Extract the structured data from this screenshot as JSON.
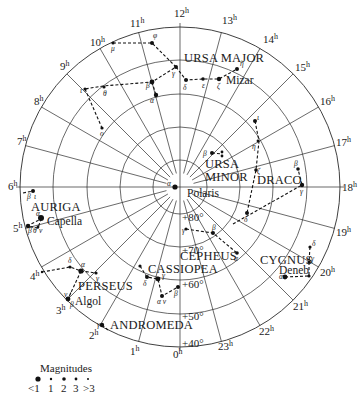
{
  "chart": {
    "center": {
      "x": 180,
      "y": 187
    },
    "outer_radius": 160,
    "colors": {
      "ink": "#1a1a1a",
      "background": "#ffffff"
    }
  },
  "ra_labels": [
    {
      "text": "12h",
      "hour": 12,
      "x": 174,
      "y": 17
    },
    {
      "text": "13h",
      "hour": 13,
      "x": 222,
      "y": 24
    },
    {
      "text": "14h",
      "hour": 14,
      "x": 263,
      "y": 43
    },
    {
      "text": "15h",
      "hour": 15,
      "x": 295,
      "y": 71
    },
    {
      "text": "16h",
      "hour": 16,
      "x": 320,
      "y": 105
    },
    {
      "text": "17h",
      "hour": 17,
      "x": 336,
      "y": 146
    },
    {
      "text": "18h",
      "hour": 18,
      "x": 342,
      "y": 191
    },
    {
      "text": "19h",
      "hour": 19,
      "x": 336,
      "y": 236
    },
    {
      "text": "20h",
      "hour": 20,
      "x": 320,
      "y": 276
    },
    {
      "text": "21h",
      "hour": 21,
      "x": 293,
      "y": 310
    },
    {
      "text": "22h",
      "hour": 22,
      "x": 259,
      "y": 335
    },
    {
      "text": "23h",
      "hour": 23,
      "x": 218,
      "y": 350
    },
    {
      "text": "0h",
      "hour": 0,
      "x": 173,
      "y": 358
    },
    {
      "text": "1h",
      "hour": 1,
      "x": 130,
      "y": 355
    },
    {
      "text": "2h",
      "hour": 2,
      "x": 89,
      "y": 339
    },
    {
      "text": "3h",
      "hour": 3,
      "x": 56,
      "y": 314
    },
    {
      "text": "4h",
      "hour": 4,
      "x": 30,
      "y": 280
    },
    {
      "text": "5h",
      "hour": 5,
      "x": 13,
      "y": 232
    },
    {
      "text": "6h",
      "hour": 6,
      "x": 8,
      "y": 190
    },
    {
      "text": "7h",
      "hour": 7,
      "x": 17,
      "y": 145
    },
    {
      "text": "8h",
      "hour": 8,
      "x": 34,
      "y": 105
    },
    {
      "text": "9h",
      "hour": 9,
      "x": 60,
      "y": 70
    },
    {
      "text": "10h",
      "hour": 10,
      "x": 90,
      "y": 46
    },
    {
      "text": "11h",
      "hour": 11,
      "x": 130,
      "y": 27
    }
  ],
  "dec_labels": [
    {
      "text": "+80°",
      "dec": 80,
      "radius": 27,
      "x": 183,
      "y": 221
    },
    {
      "text": "+70°",
      "dec": 70,
      "radius": 60,
      "x": 183,
      "y": 253
    },
    {
      "text": "+60°",
      "dec": 60,
      "radius": 93,
      "x": 183,
      "y": 288
    },
    {
      "text": "+50°",
      "dec": 50,
      "radius": 127,
      "x": 183,
      "y": 320
    },
    {
      "text": "+40°",
      "dec": 40,
      "radius": 160,
      "x": 183,
      "y": 347
    }
  ],
  "constellations": [
    {
      "name": "URSA MAJOR",
      "label_x": 192,
      "label_y": 62
    },
    {
      "name": "URSA MINOR",
      "label_lines": [
        "URSA",
        "MINOR"
      ],
      "label_x": 218,
      "label_y": 163
    },
    {
      "name": "DRACO",
      "label_x": 256,
      "label_y": 185
    },
    {
      "name": "CEPHEUS",
      "label_x": 180,
      "label_y": 258
    },
    {
      "name": "CASSIOPEA",
      "label_x": 148,
      "label_y": 282
    },
    {
      "name": "CYGNUS",
      "label_x": 260,
      "label_y": 262
    },
    {
      "name": "PERSEUS",
      "label_x": 78,
      "label_y": 291
    },
    {
      "name": "ANDROMEDA",
      "label_x": 110,
      "label_y": 327
    },
    {
      "name": "AURIGA",
      "label_x": 30,
      "label_y": 212
    }
  ],
  "named_stars": [
    {
      "name": "Polaris",
      "x": 187,
      "y": 196
    },
    {
      "name": "Mizar",
      "x": 232,
      "y": 84
    },
    {
      "name": "Capella",
      "x": 47,
      "y": 224
    },
    {
      "name": "Algol",
      "x": 75,
      "y": 305
    },
    {
      "name": "Deneb",
      "x": 278,
      "y": 273
    }
  ],
  "legend": {
    "title": "Magnitudes",
    "items": [
      {
        "label": "<1",
        "size": 3.2
      },
      {
        "label": "1",
        "size": 1.4
      },
      {
        "label": "2",
        "size": 2.2
      },
      {
        "label": "3",
        "size": 1.6
      },
      {
        "label": ">3",
        "size": 1.0
      }
    ]
  }
}
